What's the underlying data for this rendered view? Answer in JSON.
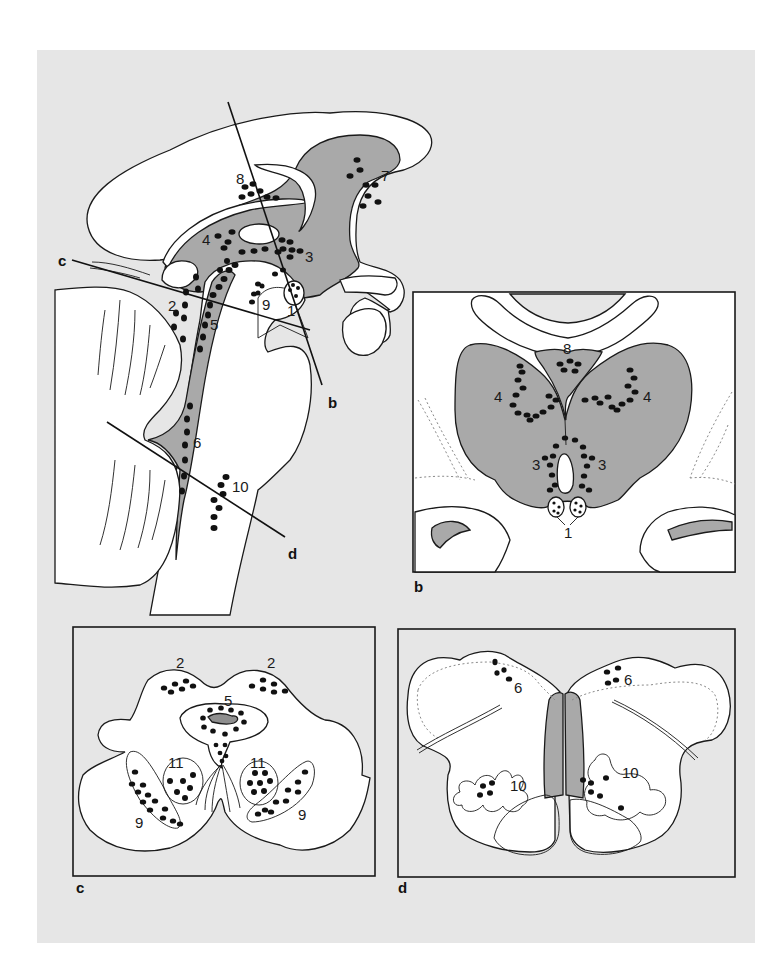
{
  "figure": {
    "background_color": "#e6e6e6",
    "gray_region_color": "#a9a9a9",
    "white_region_color": "#ffffff",
    "ventricle_color": "#8f8f8f"
  },
  "sagittal_view": {
    "cut_lines": [
      {
        "label": "b"
      },
      {
        "label": "c"
      },
      {
        "label": "d"
      }
    ],
    "nucleus_labels": [
      "1",
      "2",
      "3",
      "4",
      "5",
      "6",
      "7",
      "8",
      "9",
      "10"
    ]
  },
  "panel_b": {
    "panel_label": "b",
    "nucleus_labels": {
      "left_4": "4",
      "right_4": "4",
      "top_8": "8",
      "left_3": "3",
      "right_3": "3",
      "bottom_1": "1"
    }
  },
  "panel_c": {
    "panel_label": "c",
    "nucleus_labels": {
      "left_2": "2",
      "right_2": "2",
      "center_5": "5",
      "left_11": "11",
      "right_11": "11",
      "left_9": "9",
      "right_9": "9"
    }
  },
  "panel_d": {
    "panel_label": "d",
    "nucleus_labels": {
      "left_6": "6",
      "right_6": "6",
      "left_10": "10",
      "right_10": "10"
    }
  }
}
